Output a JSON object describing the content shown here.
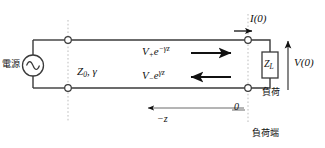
{
  "diagram": {
    "colors": {
      "wire": "#3a3a3a",
      "arrow": "#111111",
      "dotted": "#b9b9b9",
      "text": "#111111",
      "background": "#ffffff"
    },
    "labels": {
      "source": "電源",
      "line_params": "Z",
      "line_params_sub": "0",
      "line_params_rest": ", γ",
      "forward_wave_v": "V",
      "forward_wave_sub": "+",
      "forward_wave_exp": "e",
      "forward_wave_exp_sup": "−γz",
      "backward_wave_v": "V",
      "backward_wave_sub": "−",
      "backward_wave_exp": "e",
      "backward_wave_exp_sup": "γz",
      "current": "I(0)",
      "voltage": "V(0)",
      "load_impedance": "Z",
      "load_impedance_sub": "L",
      "load": "負荷",
      "origin": "0",
      "axis": "−z",
      "load_terminal": "負荷端"
    },
    "icons": {
      "ac_source": "ac-source-icon",
      "terminal": "terminal-node-icon",
      "forward_arrow": "right-arrow-icon",
      "backward_arrow": "left-arrow-icon",
      "current_arrow": "current-direction-arrow-icon",
      "voltage_arrow": "voltage-direction-arrow-icon",
      "axis_arrow": "axis-direction-arrow-icon"
    }
  }
}
